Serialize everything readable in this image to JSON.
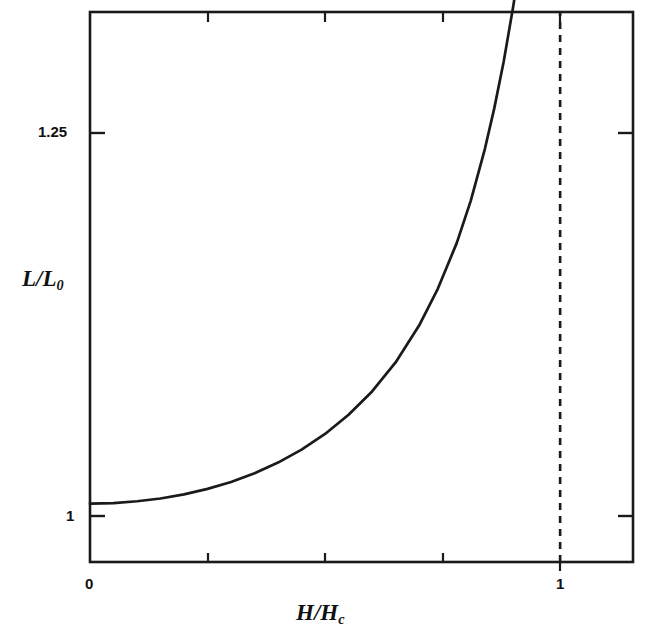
{
  "figure": {
    "background_color": "#ffffff",
    "line_color": "#1a1a1a",
    "axis_color": "#1a1a1a"
  },
  "axes": {
    "y_title": "L/L",
    "y_title_sub": "0",
    "x_title": "H/H",
    "x_title_sub": "c",
    "y_ticks": [
      {
        "label": "1",
        "value": 1
      },
      {
        "label": "1.25",
        "value": 1.25
      }
    ],
    "x_ticks": [
      {
        "label": "0",
        "value": 0
      },
      {
        "label": "1",
        "value": 1
      }
    ]
  },
  "chart_data": {
    "type": "line",
    "title": "",
    "subtitle": "",
    "xlabel": "H/H_c",
    "ylabel": "L/L_0",
    "xlim": [
      0,
      1.155
    ],
    "ylim": [
      0.968,
      1.2695
    ],
    "grid": false,
    "legend": null,
    "x_tick_values": [
      0,
      0.25,
      0.5,
      0.75,
      1.0
    ],
    "x_tick_labels": [
      "0",
      "",
      "",
      "",
      "1"
    ],
    "y_tick_values": [
      1,
      1.25
    ],
    "y_tick_labels": [
      "1",
      "1.25"
    ],
    "series": [
      {
        "name": "L/L0 divergence",
        "style": "solid",
        "x": [
          0.0,
          0.05,
          0.1,
          0.15,
          0.2,
          0.25,
          0.3,
          0.35,
          0.4,
          0.45,
          0.5,
          0.55,
          0.6,
          0.65,
          0.7,
          0.74,
          0.78,
          0.81,
          0.84,
          0.86,
          0.88,
          0.9,
          0.91,
          0.92,
          0.93,
          0.94,
          0.945,
          0.95,
          0.955,
          0.96,
          0.965,
          0.968,
          0.97,
          0.9715
        ],
        "y": [
          1.0,
          1.0003,
          1.0013,
          1.0028,
          1.0051,
          1.0081,
          1.0119,
          1.0166,
          1.0225,
          1.0296,
          1.0382,
          1.0487,
          1.0615,
          1.0774,
          1.0976,
          1.1179,
          1.1428,
          1.1661,
          1.1945,
          1.2168,
          1.2424,
          1.2722,
          1.289,
          1.3072,
          1.3272,
          1.349,
          1.3608,
          1.3731,
          1.3862,
          1.4,
          1.4146,
          1.4238,
          1.43,
          1.4348
        ]
      },
      {
        "name": "critical field asymptote",
        "style": "dashed",
        "x": [
          1.0,
          1.0
        ],
        "y": [
          0.968,
          1.2695
        ]
      }
    ],
    "annotations": [
      {
        "text": "vertical dashed asymptote at H/H_c = 1",
        "x": 1.0
      }
    ]
  }
}
